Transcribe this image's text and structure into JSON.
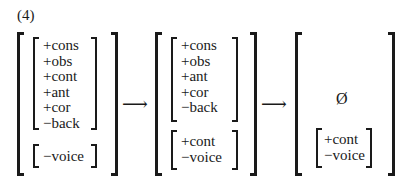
{
  "example_number": "(4)",
  "arrow": "⟶",
  "stage1": {
    "place_features": [
      "+cons",
      "+obs",
      "+cont",
      "+ant",
      "+cor",
      "−back"
    ],
    "laryngeal_features": [
      "−voice"
    ]
  },
  "stage2": {
    "place_features": [
      "+cons",
      "+obs",
      "+ant",
      "+cor",
      "−back"
    ],
    "laryngeal_features": [
      "+cont",
      "−voice"
    ]
  },
  "stage3": {
    "null_symbol": "Ø",
    "laryngeal_features": [
      "+cont",
      "−voice"
    ]
  }
}
